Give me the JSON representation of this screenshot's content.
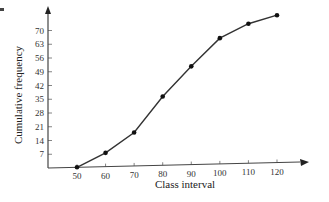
{
  "chart_data": {
    "type": "line",
    "title": "",
    "xlabel": "Class interval",
    "ylabel": "Cumulative frequency",
    "x": [
      50,
      60,
      70,
      80,
      90,
      100,
      110,
      120
    ],
    "series": [
      {
        "name": "Cumulative frequency (ogive)",
        "values": [
          0,
          7,
          17,
          35,
          50,
          64,
          71,
          75
        ]
      }
    ],
    "x_ticks": [
      50,
      60,
      70,
      80,
      90,
      100,
      110,
      120
    ],
    "y_ticks": [
      7,
      14,
      21,
      28,
      35,
      42,
      49,
      56,
      63,
      70
    ],
    "xlim": [
      40,
      130
    ],
    "ylim": [
      0,
      80
    ],
    "grid": false,
    "legend": "none",
    "markers": "filled-dot",
    "colors": {
      "line": "#333333",
      "axis": "#444444",
      "text": "#333333"
    }
  }
}
